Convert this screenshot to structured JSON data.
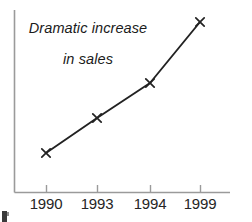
{
  "chart_data": {
    "type": "line",
    "title": "Dramatic increase\nin sales",
    "title_line_1": "Dramatic increase",
    "title_line_2": "in sales",
    "xlabel": "",
    "ylabel": "",
    "categories": [
      "1990",
      "1993",
      "1994",
      "1999"
    ],
    "values": [
      1.0,
      2.05,
      2.95,
      4.6
    ],
    "series": [
      {
        "name": "sales",
        "values": [
          1.0,
          2.05,
          2.95,
          4.6
        ]
      }
    ],
    "tick_labels": [
      "1990",
      "1993",
      "1994",
      "1999"
    ],
    "ylim": [
      0,
      5.2
    ],
    "grid": false,
    "legend": "none",
    "marker": "x-cross",
    "line_color": "#222222",
    "axis_color": "#9a9a9a",
    "background_color": "#ffffff",
    "text_color": "#1f1f1f",
    "points_px": [
      {
        "label": "1990",
        "x": 46,
        "y": 153
      },
      {
        "label": "1993",
        "x": 97,
        "y": 118
      },
      {
        "label": "1994",
        "x": 150,
        "y": 83
      },
      {
        "label": "1999",
        "x": 200,
        "y": 22
      }
    ],
    "axis_px": {
      "y_axis_x": 14,
      "y_axis_top": 10,
      "x_axis_y": 192,
      "x_axis_right": 230,
      "tick_length": 7
    }
  },
  "artifacts": {
    "corner_mark": "partial-glyph"
  }
}
